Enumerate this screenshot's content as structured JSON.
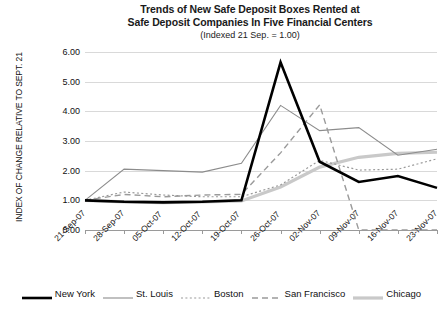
{
  "chart_data": {
    "type": "line",
    "title": "Trends of New Safe Deposit Boxes Rented at Safe Deposit Companies In Five Financial Centers",
    "title_line1": "Trends of New Safe Deposit Boxes Rented at",
    "title_line2": "Safe Deposit Companies In Five Financial Centers",
    "subtitle": "(Indexed 21 Sep. = 1.00)",
    "xlabel": "",
    "ylabel": "INDEX OF CHANGE RELATIVE TO SEPT. 21",
    "categories": [
      "21-Sep-07",
      "28-Sep-07",
      "05-Oct-07",
      "12-Oct-07",
      "19-Oct-07",
      "26-Oct-07",
      "02-Nov-07",
      "09-Nov-07",
      "16-Nov-07",
      "23-Nov-07"
    ],
    "ylim": [
      0,
      6
    ],
    "yticks": [
      "0.00",
      "1.00",
      "2.00",
      "3.00",
      "4.00",
      "5.00",
      "6.00"
    ],
    "ytick_values": [
      0,
      1,
      2,
      3,
      4,
      5,
      6
    ],
    "grid": true,
    "legend_position": "bottom",
    "series": [
      {
        "name": "New York",
        "color": "#000000",
        "style": "solid",
        "width": 2.6,
        "values": [
          1.0,
          0.95,
          0.93,
          0.95,
          1.0,
          5.65,
          2.3,
          1.62,
          1.82,
          1.42
        ]
      },
      {
        "name": "St. Louis",
        "color": "#8c8c8c",
        "style": "solid",
        "width": 1.1,
        "values": [
          1.0,
          2.05,
          2.0,
          1.95,
          2.25,
          4.2,
          3.35,
          3.45,
          2.52,
          2.72
        ]
      },
      {
        "name": "Boston",
        "color": "#9a9a9a",
        "style": "dotted",
        "width": 1.2,
        "values": [
          1.0,
          1.28,
          1.18,
          1.12,
          1.12,
          1.52,
          2.35,
          2.02,
          2.05,
          2.4
        ]
      },
      {
        "name": "San Francisco",
        "color": "#9a9a9a",
        "style": "dashed",
        "width": 1.4,
        "values": [
          1.0,
          1.2,
          1.12,
          1.18,
          1.2,
          2.6,
          4.22,
          0.0,
          0.0,
          0.0
        ]
      },
      {
        "name": "Chicago",
        "color": "#c9c9c9",
        "style": "solid",
        "width": 3.2,
        "values": [
          1.0,
          0.95,
          0.92,
          0.95,
          0.98,
          1.45,
          2.12,
          2.45,
          2.58,
          2.62
        ]
      }
    ]
  },
  "legend": {
    "items": [
      {
        "label": "New York"
      },
      {
        "label": "St. Louis"
      },
      {
        "label": "Boston"
      },
      {
        "label": "San Francisco"
      },
      {
        "label": "Chicago"
      }
    ]
  }
}
